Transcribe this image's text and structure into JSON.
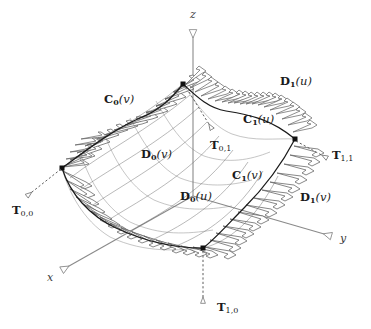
{
  "figure": {
    "background_color": "#ffffff",
    "ink_color": "#1a1a1a",
    "axis_color": "#8a8a8a",
    "arrow_color": "#6f6f6f",
    "surface_line_color": "#2b2b2b"
  },
  "axes": [
    {
      "id": "x",
      "label": "x",
      "style": "italic",
      "arrowhead": "hollow",
      "x": 47,
      "y": 279
    },
    {
      "id": "y",
      "label": "y",
      "style": "italic",
      "arrowhead": "hollow",
      "x": 340,
      "y": 240
    },
    {
      "id": "z",
      "label": "z",
      "style": "italic",
      "arrowhead": "hollow",
      "x": 190,
      "y": 15
    }
  ],
  "boundary_curve_labels": [
    {
      "id": "C0v",
      "base": "C",
      "subscript": "0",
      "argument": "(v)",
      "x": 104,
      "y": 100
    },
    {
      "id": "C1u",
      "base": "C",
      "subscript": "1",
      "argument": "(u)",
      "x": 243,
      "y": 120
    },
    {
      "id": "C1v",
      "base": "C",
      "subscript": "1",
      "argument": "(v)",
      "x": 232,
      "y": 176
    }
  ],
  "derivative_labels": [
    {
      "id": "D0v",
      "base": "D",
      "subscript": "0",
      "argument": "(v)",
      "x": 141,
      "y": 155
    },
    {
      "id": "D1u",
      "base": "D",
      "subscript": "1",
      "argument": "(u)",
      "x": 280,
      "y": 82
    },
    {
      "id": "D0u",
      "base": "D",
      "subscript": "0",
      "argument": "(u)",
      "x": 180,
      "y": 197
    },
    {
      "id": "D1v",
      "base": "D",
      "subscript": "1",
      "argument": "(v)",
      "x": 300,
      "y": 198
    }
  ],
  "twist_vector_labels": [
    {
      "id": "T00",
      "base": "T",
      "subscript": "0,0",
      "x": 12,
      "y": 211
    },
    {
      "id": "T01",
      "base": "T",
      "subscript": "0,1",
      "x": 210,
      "y": 146
    },
    {
      "id": "T11",
      "base": "T",
      "subscript": "1,1",
      "x": 332,
      "y": 156
    },
    {
      "id": "T10",
      "base": "T",
      "subscript": "1,0",
      "x": 217,
      "y": 308
    }
  ],
  "corner_points": [
    {
      "id": "corner-u0v0",
      "x": 62,
      "y": 168
    },
    {
      "id": "corner-u0v1",
      "x": 183,
      "y": 84
    },
    {
      "id": "corner-u1v1",
      "x": 295,
      "y": 139
    },
    {
      "id": "corner-u1v0",
      "x": 203,
      "y": 248
    }
  ]
}
